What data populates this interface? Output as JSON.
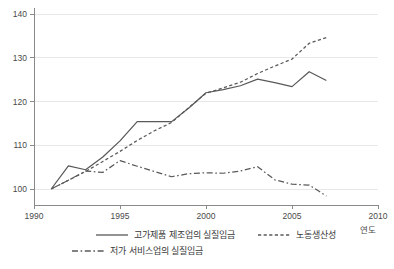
{
  "chart_data": {
    "type": "line",
    "title": "",
    "xlabel": "연도",
    "ylabel": "",
    "xlim": [
      1990,
      2010
    ],
    "ylim": [
      96,
      142
    ],
    "grid": true,
    "legend_position": "bottom",
    "x_ticks": [
      "1990",
      "1995",
      "2000",
      "2005",
      "2010"
    ],
    "x_tick_values": [
      1990,
      1995,
      2000,
      2005,
      2010
    ],
    "y_ticks": [
      "100",
      "110",
      "120",
      "130",
      "140"
    ],
    "y_tick_values": [
      100,
      110,
      120,
      130,
      140
    ],
    "series": [
      {
        "name": "고가제품 제조업의 실질임금",
        "style": "solid",
        "x": [
          1991,
          1992,
          1993,
          1994,
          1995,
          1996,
          1997,
          1998,
          1999,
          2000,
          2001,
          2002,
          2003,
          2004,
          2005,
          2006,
          2007
        ],
        "values": [
          100.0,
          105.3,
          104.4,
          107.3,
          111.0,
          115.4,
          115.4,
          115.4,
          118.5,
          122.0,
          122.7,
          123.6,
          125.1,
          124.3,
          123.4,
          126.8,
          124.8
        ]
      },
      {
        "name": "노동생산성",
        "style": "dashed",
        "x": [
          1991,
          1992,
          1993,
          1994,
          1995,
          1996,
          1997,
          1998,
          1999,
          2000,
          2001,
          2002,
          2003,
          2004,
          2005,
          2006,
          2007
        ],
        "values": [
          100.0,
          102.0,
          104.0,
          106.3,
          108.6,
          111.1,
          113.3,
          115.2,
          118.6,
          121.9,
          123.1,
          124.4,
          126.4,
          128.1,
          129.7,
          133.3,
          134.6
        ]
      },
      {
        "name": "저가 서비스업의 실질임금",
        "style": "dashdot",
        "x": [
          1991,
          1992,
          1993,
          1994,
          1995,
          1996,
          1997,
          1998,
          1999,
          2000,
          2001,
          2002,
          2003,
          2004,
          2005,
          2006,
          2007
        ],
        "values": [
          100.0,
          102.0,
          104.1,
          103.8,
          106.5,
          105.2,
          104.0,
          102.8,
          103.5,
          103.7,
          103.6,
          104.1,
          105.1,
          102.1,
          101.1,
          100.9,
          98.4
        ]
      }
    ]
  },
  "axis": {
    "x_label": "연도"
  },
  "legend": {
    "items": [
      {
        "label": "고가제품 제조업의 실질임금",
        "style": "solid"
      },
      {
        "label": "노동생산성",
        "style": "dashed"
      },
      {
        "label": "저가 서비스업의 실질임금",
        "style": "dashdot"
      }
    ]
  },
  "colors": {
    "line": "#595959",
    "grid": "#e8e8e8",
    "axis": "#8a8a8a",
    "text": "#3a3a3a",
    "background": "#ffffff"
  }
}
